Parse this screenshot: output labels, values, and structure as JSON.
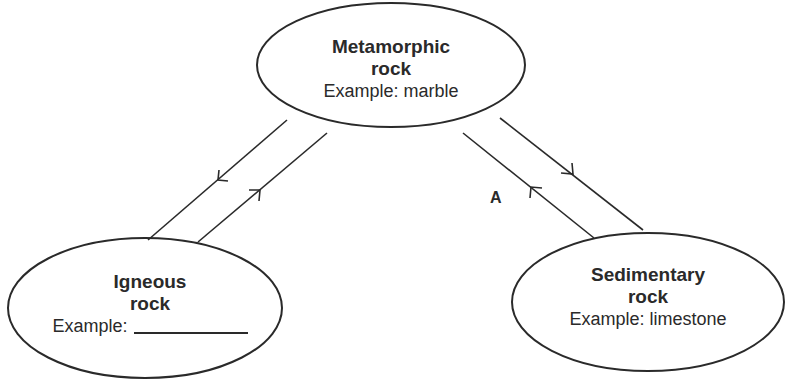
{
  "nodes": {
    "metamorphic": {
      "title_line1": "Metamorphic",
      "title_line2": "rock",
      "example": "Example: marble"
    },
    "igneous": {
      "title_line1": "Igneous",
      "title_line2": "rock",
      "example_prefix": "Example:",
      "example_blank": ""
    },
    "sedimentary": {
      "title_line1": "Sedimentary",
      "title_line2": "rock",
      "example": "Example: limestone"
    }
  },
  "edges": [
    {
      "from": "metamorphic",
      "to": "igneous",
      "direction": "down-left"
    },
    {
      "from": "igneous",
      "to": "metamorphic",
      "direction": "up-right"
    },
    {
      "from": "metamorphic",
      "to": "sedimentary",
      "direction": "down-right"
    },
    {
      "from": "sedimentary",
      "to": "metamorphic",
      "direction": "up-left",
      "label": "A"
    }
  ],
  "labels": {
    "a": "A"
  },
  "colors": {
    "stroke": "#2a2a2a",
    "background": "#ffffff"
  }
}
